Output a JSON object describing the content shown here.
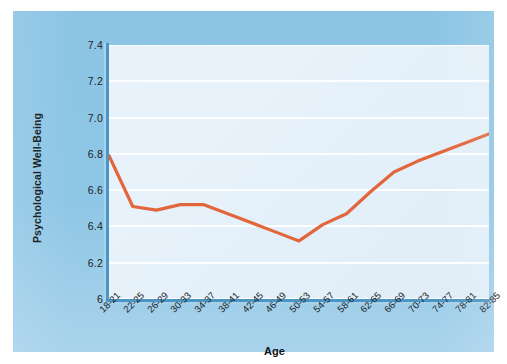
{
  "chart_data": {
    "type": "line",
    "title": "",
    "subtitle": "",
    "xlabel": "Age",
    "ylabel": "Psychological Well-Being",
    "categories": [
      "18-21",
      "22-25",
      "26-29",
      "30-33",
      "34-37",
      "38-41",
      "42-45",
      "46-49",
      "50-53",
      "54-57",
      "58-61",
      "62-65",
      "66-69",
      "70-73",
      "74-77",
      "78-81",
      "82-85"
    ],
    "values": [
      6.79,
      6.51,
      6.49,
      6.52,
      6.52,
      6.47,
      6.42,
      6.37,
      6.32,
      6.41,
      6.47,
      6.59,
      6.7,
      6.76,
      6.81,
      6.86,
      6.91
    ],
    "series": [
      {
        "name": "Psychological Well-Being",
        "values": [
          6.79,
          6.51,
          6.49,
          6.52,
          6.52,
          6.47,
          6.42,
          6.37,
          6.32,
          6.41,
          6.47,
          6.59,
          6.7,
          6.76,
          6.81,
          6.86,
          6.91
        ],
        "color": "#e2663b"
      }
    ],
    "ylim": [
      6.0,
      7.4
    ],
    "ytick_labels": [
      "7.4",
      "7.2",
      "7.0",
      "6.8",
      "6.6",
      "6.4",
      "6.2",
      "6"
    ],
    "ytick_values": [
      7.4,
      7.2,
      7.0,
      6.8,
      6.6,
      6.4,
      6.2,
      6.0
    ],
    "grid": true,
    "grid_color": "#ffffff",
    "legend": false,
    "legend_position": "none",
    "annotations": []
  },
  "style": {
    "panel_color": "#8cc5e4",
    "plot_background": "#e7f1fa",
    "axis_color": "#4a95c4",
    "line_color": "#e2663b",
    "text_color": "#1b2327",
    "page_background": "#ffffff"
  }
}
